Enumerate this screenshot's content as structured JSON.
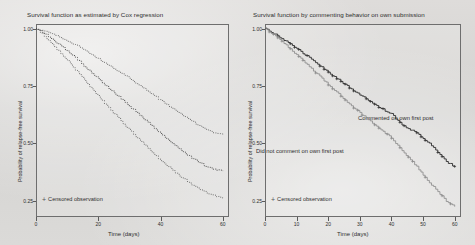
{
  "figure": {
    "background_color": "#d8d8d6",
    "axis_color": "#6e6e6e"
  },
  "panels": [
    {
      "id": "cox-regression",
      "title": "Survival function as estimated by Cox regression",
      "xlabel": "Time (days)",
      "ylabel": "Probability of relapse-free survival",
      "legend_label": "Censored observation",
      "legend_marker": "plus-marker-icon"
    },
    {
      "id": "commenting-behavior",
      "title": "Survival function by commenting behavior on own submission",
      "xlabel": "Time (days)",
      "ylabel": "Probability of relapse-free survival",
      "legend_label": "Censored observation",
      "legend_marker": "plus-marker-icon",
      "annotation_upper": "Commented on own first post",
      "annotation_lower": "Did not comment on own first post"
    }
  ],
  "chart_data": [
    {
      "type": "line",
      "id": "cox-regression",
      "title": "Survival function as estimated by Cox regression",
      "xlabel": "Time (days)",
      "ylabel": "Probability of relapse-free survival",
      "xlim": [
        0,
        62
      ],
      "ylim": [
        0.18,
        1.02
      ],
      "xticks": [
        0,
        20,
        40,
        60
      ],
      "ytick_labels": [
        "1.00",
        "0.75",
        "0.50",
        "0.25"
      ],
      "yticks": [
        1.0,
        0.75,
        0.5,
        0.25
      ],
      "grid": false,
      "legend_position": "inside-lower-left",
      "series": [
        {
          "name": "Cox estimate",
          "style": "solid-step",
          "x": [
            0,
            2,
            4,
            6,
            8,
            10,
            12,
            14,
            16,
            18,
            20,
            22,
            24,
            26,
            28,
            30,
            32,
            34,
            36,
            38,
            40,
            42,
            44,
            46,
            48,
            50,
            52,
            54,
            56,
            58,
            60
          ],
          "y": [
            1.0,
            0.985,
            0.966,
            0.945,
            0.925,
            0.903,
            0.88,
            0.856,
            0.831,
            0.806,
            0.781,
            0.757,
            0.733,
            0.71,
            0.687,
            0.663,
            0.639,
            0.614,
            0.59,
            0.566,
            0.542,
            0.519,
            0.497,
            0.476,
            0.456,
            0.437,
            0.42,
            0.405,
            0.393,
            0.384,
            0.38
          ]
        },
        {
          "name": "Upper 95% confidence band",
          "style": "dotted",
          "x": [
            0,
            2,
            4,
            6,
            8,
            10,
            12,
            14,
            16,
            18,
            20,
            22,
            24,
            26,
            28,
            30,
            32,
            34,
            36,
            38,
            40,
            42,
            44,
            46,
            48,
            50,
            52,
            54,
            56,
            58,
            60
          ],
          "y": [
            1.0,
            0.993,
            0.983,
            0.972,
            0.96,
            0.947,
            0.933,
            0.918,
            0.902,
            0.886,
            0.869,
            0.852,
            0.835,
            0.818,
            0.801,
            0.783,
            0.764,
            0.745,
            0.726,
            0.707,
            0.688,
            0.669,
            0.65,
            0.632,
            0.614,
            0.597,
            0.581,
            0.566,
            0.553,
            0.543,
            0.537
          ]
        },
        {
          "name": "Lower 95% confidence band",
          "style": "dotted",
          "x": [
            0,
            2,
            4,
            6,
            8,
            10,
            12,
            14,
            16,
            18,
            20,
            22,
            24,
            26,
            28,
            30,
            32,
            34,
            36,
            38,
            40,
            42,
            44,
            46,
            48,
            50,
            52,
            54,
            56,
            58,
            60
          ],
          "y": [
            1.0,
            0.976,
            0.95,
            0.921,
            0.892,
            0.862,
            0.831,
            0.8,
            0.768,
            0.737,
            0.706,
            0.675,
            0.645,
            0.616,
            0.587,
            0.559,
            0.531,
            0.504,
            0.478,
            0.453,
            0.428,
            0.405,
            0.382,
            0.361,
            0.341,
            0.322,
            0.305,
            0.29,
            0.278,
            0.269,
            0.264
          ]
        }
      ]
    },
    {
      "type": "line",
      "id": "commenting-behavior",
      "title": "Survival function by commenting behavior on own submission",
      "xlabel": "Time (days)",
      "ylabel": "Probability of relapse-free survival",
      "xlim": [
        0,
        62
      ],
      "ylim": [
        0.18,
        1.02
      ],
      "xticks": [
        0,
        10,
        20,
        30,
        40,
        50,
        60
      ],
      "ytick_labels": [
        "1.00",
        "0.75",
        "0.50",
        "0.25"
      ],
      "yticks": [
        1.0,
        0.75,
        0.5,
        0.25
      ],
      "grid": false,
      "legend_position": "inside-lower-left",
      "series": [
        {
          "name": "Commented on own first post",
          "style": "solid-step-dark",
          "x": [
            0,
            2,
            4,
            6,
            8,
            10,
            12,
            14,
            16,
            18,
            20,
            22,
            24,
            26,
            28,
            30,
            32,
            34,
            36,
            38,
            40,
            42,
            44,
            46,
            48,
            50,
            52,
            54,
            56,
            58,
            60
          ],
          "y": [
            1.0,
            0.985,
            0.968,
            0.95,
            0.932,
            0.913,
            0.893,
            0.873,
            0.852,
            0.831,
            0.81,
            0.79,
            0.77,
            0.75,
            0.731,
            0.712,
            0.694,
            0.676,
            0.659,
            0.643,
            0.628,
            0.6,
            0.575,
            0.56,
            0.545,
            0.52,
            0.5,
            0.47,
            0.44,
            0.415,
            0.4
          ]
        },
        {
          "name": "Did not comment on own first post",
          "style": "solid-step-light",
          "x": [
            0,
            2,
            4,
            6,
            8,
            10,
            12,
            14,
            16,
            18,
            20,
            22,
            24,
            26,
            28,
            30,
            32,
            34,
            36,
            38,
            40,
            42,
            44,
            46,
            48,
            50,
            52,
            54,
            56,
            58,
            60
          ],
          "y": [
            1.0,
            0.98,
            0.958,
            0.935,
            0.911,
            0.886,
            0.861,
            0.835,
            0.809,
            0.783,
            0.757,
            0.731,
            0.706,
            0.681,
            0.657,
            0.633,
            0.61,
            0.588,
            0.566,
            0.545,
            0.525,
            0.49,
            0.46,
            0.43,
            0.4,
            0.36,
            0.33,
            0.3,
            0.27,
            0.24,
            0.225
          ]
        }
      ]
    }
  ]
}
